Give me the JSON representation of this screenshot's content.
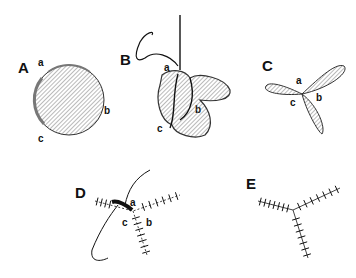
{
  "figure": {
    "panels": [
      {
        "id": "A",
        "label": "A",
        "points": [
          "a",
          "b",
          "c"
        ],
        "description": "circular flap, hatched"
      },
      {
        "id": "B",
        "label": "B",
        "points": [
          "a",
          "b",
          "c"
        ],
        "description": "folded flap with suture being placed"
      },
      {
        "id": "C",
        "label": "C",
        "points": [
          "a",
          "b",
          "c"
        ],
        "description": "three-lobed trefoil configuration"
      },
      {
        "id": "D",
        "label": "D",
        "points": [
          "a",
          "b",
          "c"
        ],
        "description": "three-limb closure being sutured"
      },
      {
        "id": "E",
        "label": "E",
        "points": [],
        "description": "completed Y-shaped sutured closure"
      }
    ],
    "colors": {
      "ink": "#111111",
      "hatch": "#555555",
      "shade": "#888888",
      "background": "#ffffff"
    }
  }
}
